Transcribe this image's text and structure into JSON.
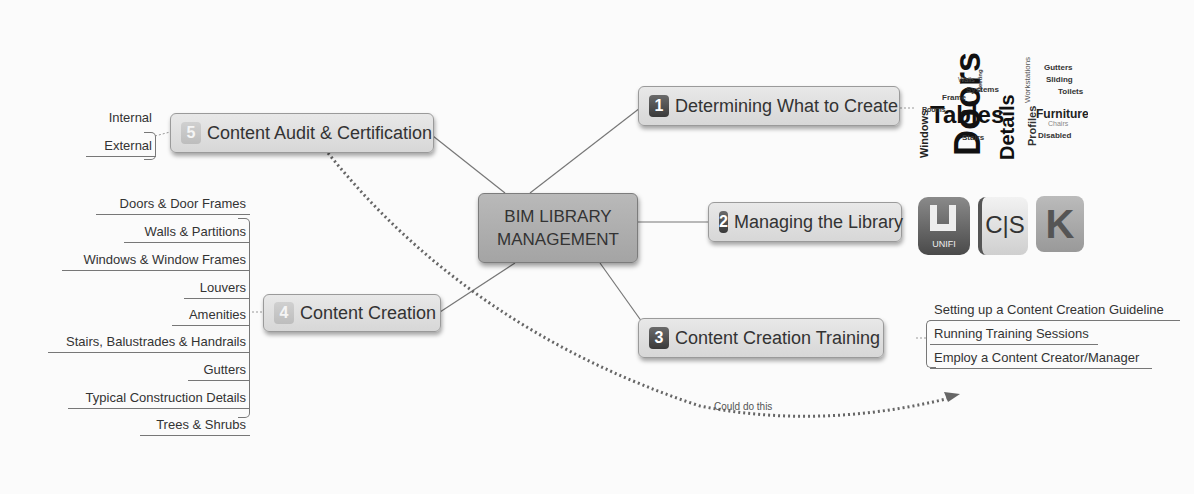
{
  "diagram": {
    "type": "mind-map",
    "central": {
      "line1": "BIM LIBRARY",
      "line2": "MANAGEMENT"
    },
    "branches": [
      {
        "num": "1",
        "label": "Determining What to Create",
        "image": "word-cloud"
      },
      {
        "num": "2",
        "label": "Managing the Library",
        "image": "software-logos"
      },
      {
        "num": "3",
        "label": "Content Creation Training",
        "children": [
          "Setting up a Content Creation Guideline",
          "Running Training Sessions",
          "Employ a Content Creator/Manager"
        ]
      },
      {
        "num": "4",
        "label": "Content Creation",
        "children": [
          "Doors & Door Frames",
          "Walls & Partitions",
          "Windows & Window Frames",
          "Louvers",
          "Amenities",
          "Stairs, Balustrades & Handrails",
          "Gutters",
          "Typical Construction Details",
          "Trees & Shrubs"
        ]
      },
      {
        "num": "5",
        "label": "Content Audit & Certification",
        "children": [
          "Internal",
          "External"
        ]
      }
    ],
    "relationship": {
      "from": "5",
      "to": "3",
      "label": "Could do this",
      "style": "dotted-arrow"
    },
    "word_cloud": {
      "large": [
        "Doors",
        "Tables",
        "Details"
      ],
      "medium": [
        "Furniture",
        "Windows",
        "Profiles",
        "Workstations",
        "Partitions",
        "Gutters",
        "Sliding",
        "Toilets",
        "Systems",
        "Frame",
        "Rooms",
        "Walls",
        "Stairs",
        "Disabled",
        "Chairs",
        "Meeting"
      ]
    },
    "logos": [
      {
        "name": "UNIFI",
        "label": "UNIFI"
      },
      {
        "name": "CS",
        "label": "C|S"
      },
      {
        "name": "K",
        "label": "K"
      }
    ]
  }
}
